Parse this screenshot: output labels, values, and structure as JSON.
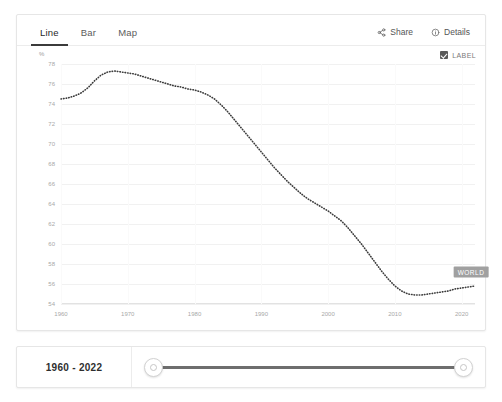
{
  "tabs": [
    {
      "label": "Line",
      "active": true
    },
    {
      "label": "Bar",
      "active": false
    },
    {
      "label": "Map",
      "active": false
    }
  ],
  "actions": {
    "share_label": "Share",
    "details_label": "Details"
  },
  "legend": {
    "checkbox_label": "LABEL",
    "checked": true
  },
  "axis_unit": "%",
  "series_label": "WORLD",
  "timeline": {
    "range_label": "1960 - 2022",
    "start_year": 1960,
    "end_year": 2022
  },
  "colors": {
    "line": "#3c3c3c",
    "label_badge": "#a0a0a0",
    "grid": "#f1f1f1",
    "tab_active_underline": "#3b3b3b",
    "track": "#6e6e6e"
  },
  "chart_data": {
    "type": "line",
    "title": "",
    "subtitle": "",
    "xlabel": "",
    "ylabel": "%",
    "xlim": [
      1960,
      2022
    ],
    "ylim": [
      54,
      78
    ],
    "grid": true,
    "legend_position": "inline-end-label",
    "line_style": "dotted",
    "xticks": [
      1960,
      1970,
      1980,
      1990,
      2000,
      2010,
      2020
    ],
    "yticks": [
      78,
      76,
      74,
      72,
      70,
      68,
      66,
      64,
      62,
      60,
      58,
      56,
      54
    ],
    "series": [
      {
        "name": "WORLD",
        "x": [
          1960,
          1961,
          1962,
          1963,
          1964,
          1965,
          1966,
          1967,
          1968,
          1969,
          1970,
          1971,
          1972,
          1973,
          1974,
          1975,
          1976,
          1977,
          1978,
          1979,
          1980,
          1981,
          1982,
          1983,
          1984,
          1985,
          1986,
          1987,
          1988,
          1989,
          1990,
          1991,
          1992,
          1993,
          1994,
          1995,
          1996,
          1997,
          1998,
          1999,
          2000,
          2001,
          2002,
          2003,
          2004,
          2005,
          2006,
          2007,
          2008,
          2009,
          2010,
          2011,
          2012,
          2013,
          2014,
          2015,
          2016,
          2017,
          2018,
          2019,
          2020,
          2021,
          2022
        ],
        "values": [
          74.5,
          74.6,
          74.8,
          75.1,
          75.6,
          76.3,
          76.9,
          77.2,
          77.3,
          77.2,
          77.1,
          77.0,
          76.8,
          76.6,
          76.4,
          76.2,
          76.0,
          75.8,
          75.7,
          75.5,
          75.4,
          75.2,
          74.9,
          74.5,
          73.9,
          73.2,
          72.4,
          71.6,
          70.8,
          70.0,
          69.2,
          68.4,
          67.6,
          66.9,
          66.2,
          65.6,
          65.0,
          64.5,
          64.1,
          63.7,
          63.3,
          62.8,
          62.3,
          61.6,
          60.8,
          60.0,
          59.1,
          58.2,
          57.3,
          56.5,
          55.8,
          55.3,
          55.0,
          54.9,
          54.9,
          55.0,
          55.1,
          55.2,
          55.3,
          55.5,
          55.6,
          55.7,
          55.8
        ]
      }
    ]
  }
}
